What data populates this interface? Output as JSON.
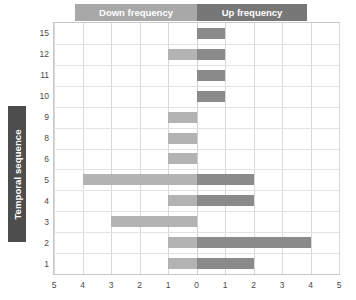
{
  "chart_data": {
    "type": "bar",
    "orientation": "horizontal",
    "layout": "diverging-bidirectional",
    "title": "",
    "xlabel": "",
    "ylabel": "Temporal sequence",
    "xlim": [
      -5,
      5
    ],
    "xticks": [
      5,
      4,
      3,
      2,
      1,
      0,
      1,
      2,
      3,
      4,
      5
    ],
    "xtick_labels": [
      "5",
      "4",
      "3",
      "2",
      "1",
      "0",
      "1",
      "2",
      "3",
      "4",
      "5"
    ],
    "grid": true,
    "legend_position": "top",
    "categories": [
      "15",
      "12",
      "11",
      "10",
      "9",
      "8",
      "6",
      "5",
      "4",
      "3",
      "2",
      "1"
    ],
    "series": [
      {
        "name": "Down frequency",
        "color": "#b3b3b3",
        "direction": "left",
        "values": [
          0,
          1,
          0,
          0,
          1,
          1,
          1,
          4,
          1,
          3,
          1,
          1
        ]
      },
      {
        "name": "Up frequency",
        "color": "#8a8a8a",
        "direction": "right",
        "values": [
          1,
          1,
          1,
          1,
          0,
          0,
          0,
          2,
          2,
          0,
          4,
          2
        ]
      }
    ]
  },
  "header": {
    "down_label": "Down frequency",
    "up_label": "Up frequency",
    "down_color": "#a8a8a8",
    "up_color": "#777777"
  },
  "axis": {
    "y_title": "Temporal sequence",
    "y_title_bg": "#4d4d4d",
    "y_title_color": "#ffffff"
  }
}
